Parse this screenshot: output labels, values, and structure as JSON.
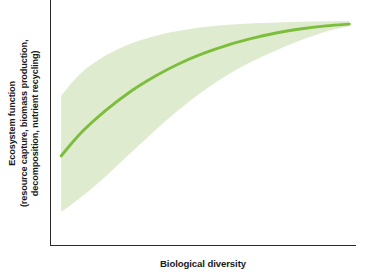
{
  "chart_data": {
    "type": "line",
    "title": "",
    "subtitle": "",
    "xlabel": "Biological diversity",
    "ylabel_lines": [
      "Ecosystem function",
      "(resource capture, biomass production,",
      "decomposition, nutrient recycling)"
    ],
    "ylabel": "Ecosystem function (resource capture, biomass production, decomposition, nutrient recycling)",
    "grid": false,
    "legend": null,
    "axis_ticks": {
      "x": [],
      "y": []
    },
    "xlim": [
      0,
      1
    ],
    "ylim": [
      0,
      1
    ],
    "colors": {
      "line": "#7cbe3c",
      "band": "#deebcf",
      "axis": "#2b2b2b",
      "text": "#1a1a1a",
      "background": "#ffffff"
    },
    "series": [
      {
        "name": "Mean ecosystem function",
        "kind": "line",
        "x": [
          0.033,
          0.1,
          0.18,
          0.26,
          0.34,
          0.42,
          0.5,
          0.58,
          0.66,
          0.74,
          0.82,
          0.9,
          0.975
        ],
        "y": [
          0.366,
          0.462,
          0.552,
          0.628,
          0.69,
          0.742,
          0.784,
          0.818,
          0.845,
          0.867,
          0.883,
          0.895,
          0.902
        ]
      },
      {
        "name": "Upper bound (uncertainty band)",
        "kind": "band-upper",
        "x": [
          0.033,
          0.1,
          0.18,
          0.26,
          0.34,
          0.42,
          0.5,
          0.58,
          0.66,
          0.74,
          0.82,
          0.9,
          0.975
        ],
        "y": [
          0.61,
          0.705,
          0.775,
          0.822,
          0.854,
          0.875,
          0.89,
          0.899,
          0.905,
          0.909,
          0.912,
          0.914,
          0.915
        ]
      },
      {
        "name": "Lower bound (uncertainty band)",
        "kind": "band-lower",
        "x": [
          0.033,
          0.1,
          0.18,
          0.26,
          0.34,
          0.42,
          0.5,
          0.58,
          0.66,
          0.74,
          0.82,
          0.9,
          0.975
        ],
        "y": [
          0.138,
          0.2,
          0.285,
          0.378,
          0.47,
          0.556,
          0.632,
          0.698,
          0.752,
          0.798,
          0.838,
          0.872,
          0.893
        ]
      }
    ],
    "annotations": []
  }
}
